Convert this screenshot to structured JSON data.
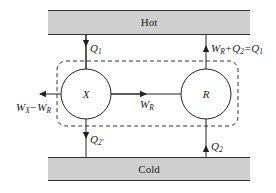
{
  "diagram": {
    "reservoirs": {
      "hot": {
        "label": "Hot",
        "fill": "#cfcfcf"
      },
      "cold": {
        "label": "Cold",
        "fill": "#cfcfcf"
      }
    },
    "engines": {
      "x": {
        "label": "X"
      },
      "r": {
        "label": "R"
      }
    },
    "flows": {
      "q1_in": {
        "symbol": "Q",
        "sub": "1",
        "direction": "down"
      },
      "r_to_hot": {
        "parts": [
          "W",
          "R",
          "+",
          "Q",
          "2",
          "=",
          "Q",
          "1"
        ],
        "direction": "up"
      },
      "x_out_work": {
        "parts": [
          "W",
          "X",
          "−",
          "W",
          "R"
        ],
        "direction": "left"
      },
      "x_to_r_work": {
        "symbol": "W",
        "sub": "R",
        "direction": "right"
      },
      "q2prime_out": {
        "symbol": "Q",
        "sub": "2'",
        "direction": "down"
      },
      "q2_in": {
        "symbol": "Q",
        "sub": "2",
        "direction": "up"
      }
    },
    "boundary": {
      "style": "dashed",
      "stroke": "#333333"
    }
  }
}
